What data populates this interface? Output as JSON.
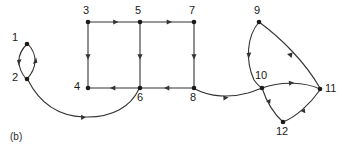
{
  "figure": {
    "caption": "(b)",
    "stroke_color": "#333333",
    "vertex_color": "#1a1a1a",
    "label_color": "#1a1a1a",
    "background": "#ffffff",
    "type": "directed-graph-diagram"
  },
  "nodes": [
    {
      "id": "1",
      "label": "1",
      "x": 27,
      "y": 44,
      "label_x": 12,
      "label_y": 37
    },
    {
      "id": "2",
      "label": "2",
      "x": 27,
      "y": 79,
      "label_x": 12,
      "label_y": 73
    },
    {
      "id": "3",
      "label": "3",
      "x": 88,
      "y": 22,
      "label_x": 83,
      "label_y": 6
    },
    {
      "id": "4",
      "label": "4",
      "x": 88,
      "y": 88,
      "label_x": 77,
      "label_y": 81
    },
    {
      "id": "5",
      "label": "5",
      "x": 140,
      "y": 22,
      "label_x": 136,
      "label_y": 6
    },
    {
      "id": "6",
      "label": "6",
      "x": 140,
      "y": 88,
      "label_x": 138,
      "label_y": 92
    },
    {
      "id": "7",
      "label": "7",
      "x": 194,
      "y": 22,
      "label_x": 189,
      "label_y": 6
    },
    {
      "id": "8",
      "label": "8",
      "x": 194,
      "y": 88,
      "label_x": 190,
      "label_y": 92
    },
    {
      "id": "9",
      "label": "9",
      "x": 259,
      "y": 22,
      "label_x": 255,
      "label_y": 6
    },
    {
      "id": "10",
      "label": "10",
      "x": 262,
      "y": 88,
      "label_x": 258,
      "label_y": 74
    },
    {
      "id": "11",
      "label": "11",
      "x": 320,
      "y": 89,
      "label_x": 324,
      "label_y": 83
    },
    {
      "id": "12",
      "label": "12",
      "x": 283,
      "y": 122,
      "label_x": 277,
      "label_y": 126
    }
  ],
  "edges": [
    {
      "from": "1",
      "to": "2",
      "shape": "arc-left"
    },
    {
      "from": "2",
      "to": "1",
      "shape": "arc-right"
    },
    {
      "from": "2",
      "to": "6",
      "shape": "long-curve-below"
    },
    {
      "from": "3",
      "to": "5",
      "shape": "straight-right"
    },
    {
      "from": "5",
      "to": "7",
      "shape": "straight-right"
    },
    {
      "from": "3",
      "to": "4",
      "shape": "straight-down"
    },
    {
      "from": "5",
      "to": "6",
      "shape": "straight-down"
    },
    {
      "from": "7",
      "to": "8",
      "shape": "straight-down"
    },
    {
      "from": "6",
      "to": "4",
      "shape": "straight-left"
    },
    {
      "from": "8",
      "to": "6",
      "shape": "straight-left"
    },
    {
      "from": "8",
      "to": "10",
      "shape": "curve-right"
    },
    {
      "from": "9",
      "to": "10",
      "shape": "arc-left-down"
    },
    {
      "from": "9",
      "to": "11",
      "shape": "arc-right-down"
    },
    {
      "from": "10",
      "to": "11",
      "shape": "arc-right"
    },
    {
      "from": "10",
      "to": "12",
      "shape": "arc-down"
    },
    {
      "from": "12",
      "to": "11",
      "shape": "arc-up-right"
    }
  ]
}
